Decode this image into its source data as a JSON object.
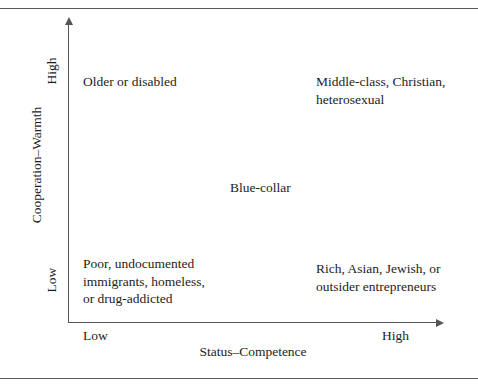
{
  "chart_data": {
    "type": "scatter",
    "title": "",
    "xlabel": "Status–Competence",
    "ylabel": "Cooperation–Warmth",
    "x_tick_labels": [
      "Low",
      "High"
    ],
    "y_tick_labels": [
      "Low",
      "High"
    ],
    "grid": false,
    "legend": "none",
    "axis_style": "arrow",
    "quadrant_labels": [
      {
        "id": "high-warmth-low-status",
        "x": "Low",
        "y": "High",
        "text": "Older or disabled"
      },
      {
        "id": "high-warmth-high-status",
        "x": "High",
        "y": "High",
        "text": "Middle-class, Christian,\nheterosexual"
      },
      {
        "id": "middle",
        "x": "Medium",
        "y": "Medium",
        "text": "Blue-collar"
      },
      {
        "id": "low-warmth-low-status",
        "x": "Low",
        "y": "Low",
        "text": "Poor, undocumented\nimmigrants, homeless,\nor drug-addicted"
      },
      {
        "id": "low-warmth-high-status",
        "x": "High",
        "y": "Low",
        "text": "Rich, Asian, Jewish, or\noutsider entrepreneurs"
      }
    ]
  },
  "figure": {
    "axes": {
      "y_title": "Cooperation–Warmth",
      "x_title": "Status–Competence",
      "y_high": "High",
      "y_low": "Low",
      "x_low": "Low",
      "x_high": "High"
    },
    "cells": {
      "top_left": "Older or disabled",
      "top_right": "Middle-class, Christian,\nheterosexual",
      "center": "Blue-collar",
      "bottom_left": "Poor, undocumented\nimmigrants, homeless,\nor drug-addicted",
      "bottom_right": "Rich, Asian, Jewish, or\noutsider entrepreneurs"
    },
    "colors": {
      "ink": "#1d1d1d",
      "rule": "#5b5b5b",
      "axis": "#555555",
      "background": "#ffffff"
    }
  }
}
